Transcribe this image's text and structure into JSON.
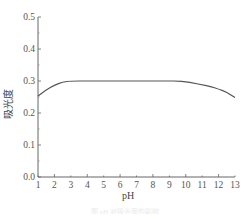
{
  "chart_data": {
    "type": "line",
    "title": "",
    "xlabel": "pH",
    "ylabel": "吸光度",
    "xlim": [
      1,
      13
    ],
    "ylim": [
      0.0,
      0.5
    ],
    "xticks": [
      1,
      2,
      3,
      4,
      5,
      6,
      7,
      8,
      9,
      10,
      11,
      12,
      13
    ],
    "yticks": [
      0.0,
      0.1,
      0.2,
      0.3,
      0.4,
      0.5
    ],
    "ytick_labels": [
      "0.0",
      "0.1",
      "0.2",
      "0.3",
      "0.4",
      "0.5"
    ],
    "grid": false,
    "legend": null,
    "series": [
      {
        "name": "absorbance",
        "color": "#555555",
        "x": [
          1,
          1.5,
          2,
          2.5,
          3,
          4,
          5,
          6,
          7,
          8,
          9,
          9.5,
          10,
          10.5,
          11,
          11.5,
          12,
          12.5,
          13
        ],
        "values": [
          0.253,
          0.272,
          0.287,
          0.297,
          0.3,
          0.3,
          0.3,
          0.3,
          0.3,
          0.3,
          0.3,
          0.3,
          0.298,
          0.293,
          0.288,
          0.283,
          0.275,
          0.265,
          0.248
        ]
      }
    ]
  },
  "caption": "图 pH 对吸光度的影响"
}
